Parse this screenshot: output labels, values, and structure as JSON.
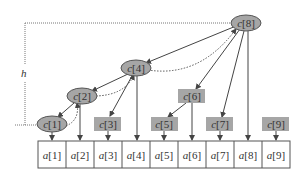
{
  "diagram": {
    "height_label": "h",
    "array_prefix": "a",
    "tree_prefix": "c",
    "array": [
      {
        "name": "a",
        "index": "1"
      },
      {
        "name": "a",
        "index": "2"
      },
      {
        "name": "a",
        "index": "3"
      },
      {
        "name": "a",
        "index": "4"
      },
      {
        "name": "a",
        "index": "5"
      },
      {
        "name": "a",
        "index": "6"
      },
      {
        "name": "a",
        "index": "7"
      },
      {
        "name": "a",
        "index": "8"
      },
      {
        "name": "a",
        "index": "9"
      }
    ],
    "nodes": [
      {
        "id": "c1",
        "label_name": "c",
        "label_index": "[1]",
        "shape": "ellipse",
        "highlighted": true
      },
      {
        "id": "c2",
        "label_name": "c",
        "label_index": "[2]",
        "shape": "ellipse",
        "highlighted": true
      },
      {
        "id": "c3",
        "label_name": "c",
        "label_index": "[3]",
        "shape": "rect",
        "highlighted": false
      },
      {
        "id": "c4",
        "label_name": "c",
        "label_index": "[4]",
        "shape": "ellipse",
        "highlighted": true
      },
      {
        "id": "c5",
        "label_name": "c",
        "label_index": "[5]",
        "shape": "rect",
        "highlighted": false
      },
      {
        "id": "c6",
        "label_name": "c",
        "label_index": "[6]",
        "shape": "rect",
        "highlighted": false
      },
      {
        "id": "c7",
        "label_name": "c",
        "label_index": "[7]",
        "shape": "rect",
        "highlighted": false
      },
      {
        "id": "c8",
        "label_name": "c",
        "label_index": "[8]",
        "shape": "ellipse",
        "highlighted": true
      },
      {
        "id": "c9",
        "label_name": "c",
        "label_index": "[9]",
        "shape": "rect",
        "highlighted": false
      }
    ],
    "colors": {
      "node_fill": "#a6a6a6",
      "line": "#444444",
      "table_border": "#555555"
    }
  }
}
